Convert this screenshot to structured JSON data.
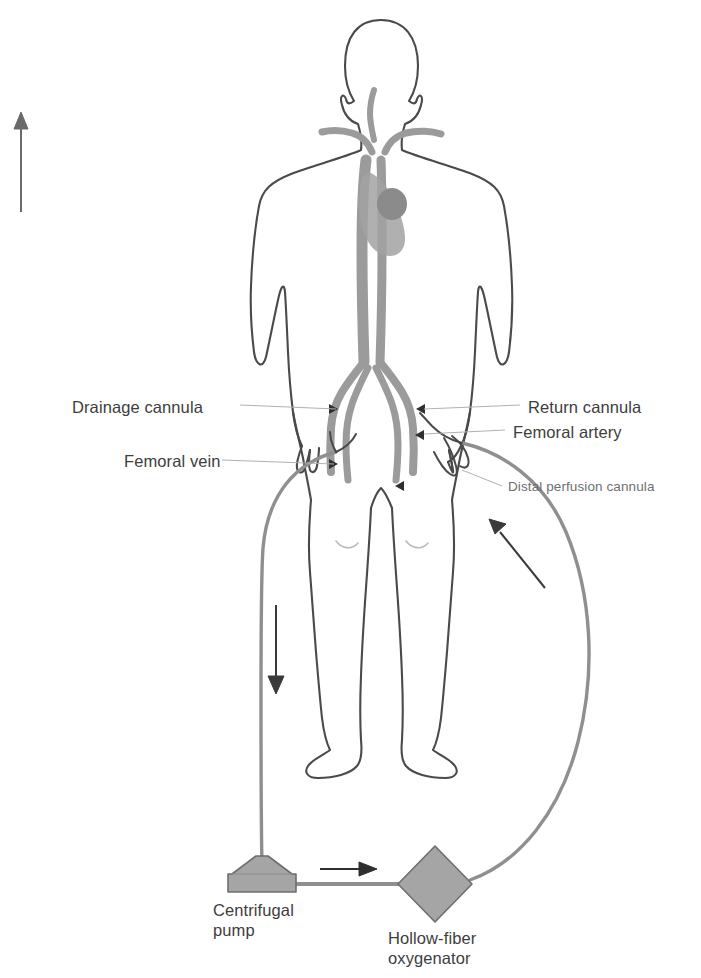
{
  "figure": {
    "background_color": "#ffffff"
  },
  "colors": {
    "body_outline": "#4a4a4a",
    "vessel_gray": "#9b9b9b",
    "heart_gray": "#8a8a8a",
    "tubing_gray": "#8f8f8f",
    "device_fill": "#a5a5a5",
    "device_stroke": "#6e6e6e",
    "label_text": "#3d3d3d",
    "label_text_faint": "#6f6f6f",
    "leader_line": "#a8a8a8",
    "arrow": "#3a3a3a"
  },
  "labels": {
    "left": [
      {
        "id": "drainage-cannula",
        "text": "Drainage cannula",
        "x": 72,
        "y": 398,
        "size": "big"
      },
      {
        "id": "femoral-vein",
        "text": "Femoral vein",
        "x": 124,
        "y": 452,
        "size": "big"
      }
    ],
    "right": [
      {
        "id": "return-cannula",
        "text": "Return cannula",
        "x": 528,
        "y": 398,
        "size": "big"
      },
      {
        "id": "femoral-artery",
        "text": "Femoral artery",
        "x": 513,
        "y": 423,
        "size": "big"
      },
      {
        "id": "distal-perfusion-cannula",
        "text": "Distal perfusion cannula",
        "x": 508,
        "y": 479,
        "size": "small"
      }
    ],
    "devices": [
      {
        "id": "centrifugal-pump",
        "line1": "Centrifugal",
        "line2": "pump",
        "x": 213,
        "y": 900
      },
      {
        "id": "hollow-fiber-oxygenator",
        "line1": "Hollow-fiber",
        "line2": "oxygenator",
        "x": 388,
        "y": 928
      }
    ]
  },
  "arrows": [
    {
      "id": "systemic-flow-arrow",
      "direction": "up",
      "meaning": "Oxygenated blood flow toward the head"
    },
    {
      "id": "drainage-flow-arrow",
      "direction": "down",
      "meaning": "Deoxygenated blood drained to the pump"
    },
    {
      "id": "pump-to-oxygenator-arrow",
      "direction": "right",
      "meaning": "Blood pumped into the oxygenator"
    },
    {
      "id": "return-flow-arrow",
      "direction": "up-left",
      "meaning": "Oxygenated blood returned to the femoral artery"
    }
  ],
  "anatomy": [
    {
      "id": "patient-body-outline",
      "text": "Patient body outline"
    },
    {
      "id": "heart",
      "text": "Heart"
    },
    {
      "id": "vena-cava-aorta",
      "text": "Vena cava / aorta"
    },
    {
      "id": "iliac-femoral-vessels",
      "text": "Iliac and femoral vessels"
    }
  ],
  "devices": [
    {
      "id": "centrifugal-pump",
      "shape": "funnel"
    },
    {
      "id": "hollow-fiber-oxygenator",
      "shape": "diamond"
    }
  ]
}
